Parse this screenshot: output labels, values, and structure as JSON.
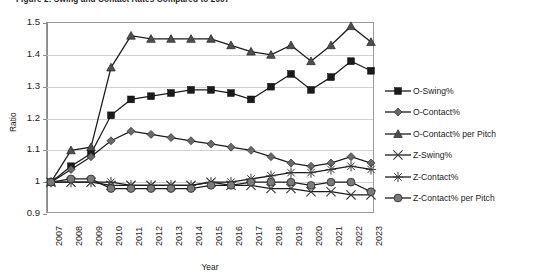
{
  "title": "Figure 2: Swing and Contact Rates Compared to 2007",
  "axis": {
    "ylabel": "Ratio",
    "xlabel": "Year",
    "yticks": [
      "1.5",
      "1.4",
      "1.3",
      "1.2",
      "1.1",
      "1",
      "0.9"
    ]
  },
  "legend": [
    {
      "label": "O-Swing%",
      "marker": "square",
      "color": "#1b1b1b"
    },
    {
      "label": "O-Contact%",
      "marker": "diamond",
      "color": "#595959"
    },
    {
      "label": "O-Contact% per Pitch",
      "marker": "triangle",
      "color": "#4a4a4a"
    },
    {
      "label": "Z-Swing%",
      "marker": "x",
      "color": "#4a4a4a"
    },
    {
      "label": "Z-Contact%",
      "marker": "star",
      "color": "#4a4a4a"
    },
    {
      "label": "Z-Contact% per Pitch",
      "marker": "circle",
      "color": "#6e6e6e"
    }
  ],
  "chart_data": {
    "type": "line",
    "title": "Figure 2: Swing and Contact Rates Compared to 2007",
    "xlabel": "Year",
    "ylabel": "Ratio",
    "ylim": [
      0.9,
      1.5
    ],
    "grid": true,
    "legend_position": "right",
    "categories": [
      "2007",
      "2008",
      "2009",
      "2010",
      "2011",
      "2012",
      "2013",
      "2014",
      "2015",
      "2016",
      "2017",
      "2018",
      "2019",
      "2020",
      "2021",
      "2022",
      "2023"
    ],
    "series": [
      {
        "name": "O-Swing%",
        "marker": "square",
        "values": [
          1.0,
          1.05,
          1.09,
          1.21,
          1.26,
          1.27,
          1.28,
          1.29,
          1.29,
          1.28,
          1.26,
          1.3,
          1.34,
          1.29,
          1.33,
          1.38,
          1.35
        ]
      },
      {
        "name": "O-Contact%",
        "marker": "diamond",
        "values": [
          1.0,
          1.04,
          1.08,
          1.13,
          1.16,
          1.15,
          1.14,
          1.13,
          1.12,
          1.11,
          1.1,
          1.08,
          1.06,
          1.05,
          1.06,
          1.08,
          1.06
        ]
      },
      {
        "name": "O-Contact% per Pitch",
        "marker": "triangle",
        "values": [
          1.0,
          1.1,
          1.11,
          1.36,
          1.46,
          1.45,
          1.45,
          1.45,
          1.45,
          1.43,
          1.41,
          1.4,
          1.43,
          1.38,
          1.43,
          1.49,
          1.44
        ]
      },
      {
        "name": "Z-Swing%",
        "marker": "x",
        "values": [
          1.0,
          1.0,
          1.0,
          0.99,
          0.99,
          0.99,
          0.99,
          0.99,
          1.0,
          0.99,
          0.99,
          0.98,
          0.98,
          0.97,
          0.97,
          0.96,
          0.96
        ]
      },
      {
        "name": "Z-Contact%",
        "marker": "star",
        "values": [
          1.0,
          1.0,
          1.0,
          1.0,
          0.99,
          0.99,
          0.99,
          0.99,
          1.0,
          1.0,
          1.01,
          1.02,
          1.03,
          1.03,
          1.04,
          1.05,
          1.04
        ]
      },
      {
        "name": "Z-Contact% per Pitch",
        "marker": "circle",
        "values": [
          1.0,
          1.01,
          1.01,
          0.98,
          0.98,
          0.98,
          0.98,
          0.98,
          0.99,
          0.99,
          1.0,
          1.0,
          1.0,
          0.99,
          1.0,
          1.0,
          0.97
        ]
      }
    ]
  }
}
